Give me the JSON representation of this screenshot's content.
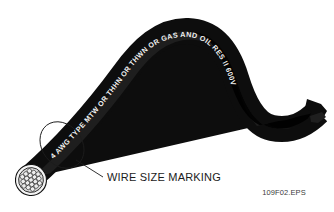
{
  "figure": {
    "background_color": "#ffffff",
    "jacket_color": "#0d0d0d",
    "marking_color": "#f2f2f2"
  },
  "cable": {
    "jacket_marking_full": "4 AWG TYPE MTW OR THHN OR THWN OR GAS AND OIL RES II 600V",
    "marking_segments": [
      {
        "id": "seg-1",
        "text": "4 AWG TYPE MTW"
      },
      {
        "id": "seg-2",
        "text": "OR THHN OR THWN OR"
      },
      {
        "id": "seg-3",
        "text": "GAS AND"
      },
      {
        "id": "seg-4",
        "text": "OIL RES II 600V"
      }
    ],
    "marking_characters": [
      "4",
      "A",
      "W",
      "G",
      "T",
      "Y",
      "P",
      "E",
      "M",
      "T",
      "W",
      "O",
      "R",
      "T",
      "H",
      "H",
      "N",
      "O",
      "R",
      "T",
      "H",
      "W",
      "N",
      "O",
      "R",
      "G",
      "A",
      "S",
      "A",
      "N",
      "D",
      "O",
      "I",
      "L",
      "R",
      "E",
      "S",
      "I",
      "I",
      "6",
      "0",
      "0",
      "V"
    ],
    "conductor_type": "stranded",
    "strand_count": 19
  },
  "callout": {
    "label": "WIRE SIZE MARKING",
    "leader_from": "marking-ellipse",
    "leader_to": "callout-label"
  },
  "credit": {
    "file_id": "109F02.EPS"
  }
}
